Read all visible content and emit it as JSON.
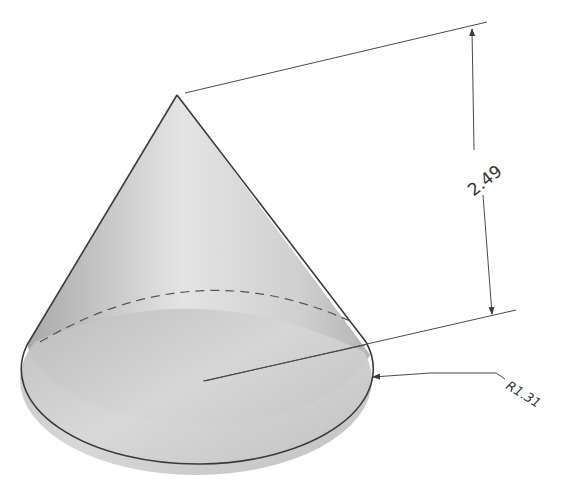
{
  "drawing": {
    "subject": "cone",
    "view": "isometric",
    "colors": {
      "line": "#3a3a3a",
      "dimension_line": "#4a4a4a",
      "shade_light": "#e6e6e6",
      "shade_mid": "#c8c8c8",
      "shade_dark": "#a8a8a8"
    },
    "dimensions": {
      "height": {
        "label": "2.49",
        "value": 2.49,
        "kind": "linear"
      },
      "radius": {
        "label": "R1.31",
        "value": 1.31,
        "kind": "radial"
      }
    },
    "hidden_edge": {
      "style": "dashed",
      "description": "back half of base circle"
    }
  }
}
